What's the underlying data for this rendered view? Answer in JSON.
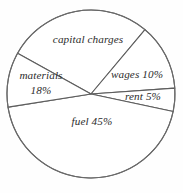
{
  "chart_data": {
    "type": "pie",
    "title": "",
    "subtitle": "",
    "xlabel": "",
    "ylabel": "",
    "legend": "none",
    "grid": false,
    "center": {
      "x": 91,
      "y": 94
    },
    "radius": 84,
    "stroke_color": "#5d5d5d",
    "fill_color": "#ffffff",
    "text_color": "#2c2c2c",
    "background_color": "#fefefe",
    "categories": [
      "capital charges",
      "materials",
      "wages",
      "rent",
      "fuel"
    ],
    "values": [
      22,
      18,
      10,
      5,
      45
    ],
    "labels": [
      "capital charges",
      "materials 18%",
      "wages 10%",
      "rent 5%",
      "fuel 45%"
    ],
    "slices": [
      {
        "name": "capital charges",
        "label": "capital charges",
        "value": 22,
        "percent_shown": "",
        "start_angle": -151,
        "end_angle": -50
      },
      {
        "name": "materials",
        "label": "materials",
        "value": 18,
        "percent_shown": "18%",
        "start_angle": 171,
        "end_angle": 209
      },
      {
        "name": "wages",
        "label": "wages 10%",
        "value": 10,
        "percent_shown": "10%",
        "start_angle": -50,
        "end_angle": -4
      },
      {
        "name": "rent",
        "label": "rent 5%",
        "value": 5,
        "percent_shown": "5%",
        "start_angle": -4,
        "end_angle": 12
      },
      {
        "name": "fuel",
        "label": "fuel 45%",
        "value": 45,
        "percent_shown": "45%",
        "start_angle": 12,
        "end_angle": 171
      }
    ]
  },
  "labels": {
    "capital_charges": "capital charges",
    "materials_name": "materials",
    "materials_pct": "18%",
    "wages": "wages 10%",
    "rent": "rent 5%",
    "fuel": "fuel 45%"
  }
}
